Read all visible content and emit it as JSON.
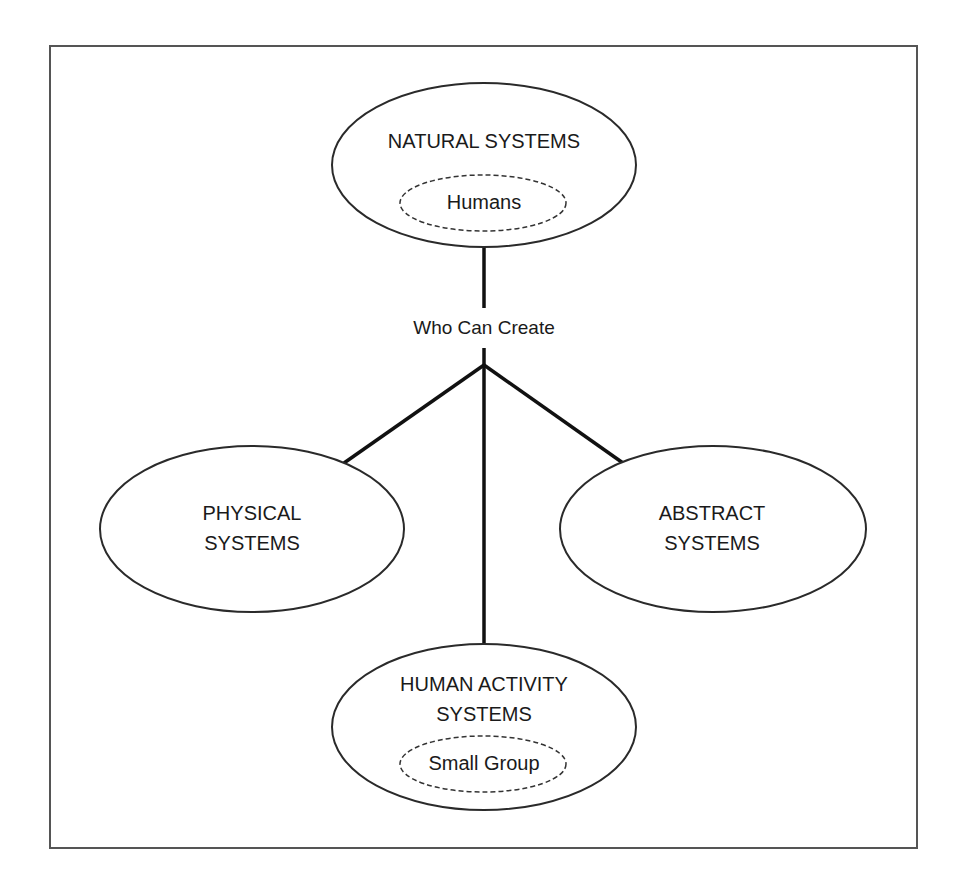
{
  "diagram": {
    "type": "hierarchy",
    "relation_label": "Who Can Create",
    "root": {
      "label": "NATURAL SYSTEMS",
      "sub_label": "Humans"
    },
    "children": [
      {
        "label_line1": "PHYSICAL",
        "label_line2": "SYSTEMS"
      },
      {
        "label_line1": "ABSTRACT",
        "label_line2": "SYSTEMS"
      },
      {
        "label_line1": "HUMAN ACTIVITY",
        "label_line2": "SYSTEMS",
        "sub_label": "Small Group"
      }
    ],
    "colors": {
      "stroke": "#2a2a2a",
      "edge": "#111111",
      "frame": "#555555",
      "text": "#1a1a1a",
      "background": "#ffffff"
    }
  }
}
